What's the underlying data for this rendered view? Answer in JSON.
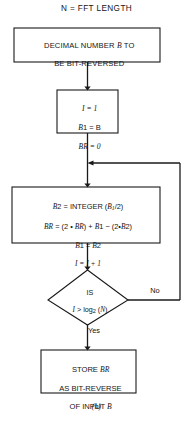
{
  "figure": {
    "caption": "(b)",
    "title": "N = FFT LENGTH",
    "line_color": "#1a1a1a",
    "background_color": "#ffffff"
  },
  "nodes": {
    "start_box": {
      "type": "process",
      "line1": "DECIMAL NUMBER B TO",
      "line2": "BE BIT-REVERSED"
    },
    "init_box": {
      "type": "process",
      "line1": "I = 1",
      "line2": "B1 = B",
      "line3": "BR = 0"
    },
    "compute_box": {
      "type": "process",
      "line1": "B2 = INTEGER (B1/2)",
      "line2": "BR = (2 * BR) + B1 - (2*B2)",
      "line3": "B1 = B2",
      "line4": "I = I + 1"
    },
    "decision": {
      "type": "decision",
      "line1": "IS",
      "line2": "I > log2 (N)",
      "yes_label": "Yes",
      "no_label": "No"
    },
    "store_box": {
      "type": "process",
      "line1": "STORE BR",
      "line2": "AS BIT-REVERSE",
      "line3": "OF INPUT B"
    }
  }
}
